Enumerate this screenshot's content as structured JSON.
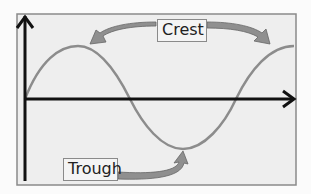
{
  "diagram": {
    "type": "wave",
    "labels": {
      "crest": "Crest",
      "trough": "Trough"
    },
    "colors": {
      "background": "#eeeeee",
      "frame": "#8a8a8a",
      "axis": "#111111",
      "wave": "#8c8c8c",
      "arrow_fill": "#8f8f8f"
    }
  }
}
